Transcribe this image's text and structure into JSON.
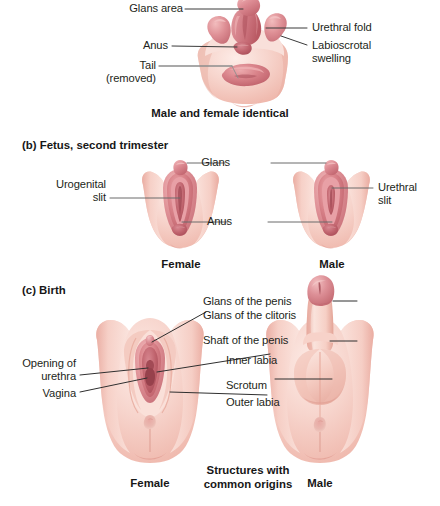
{
  "figure": {
    "title_visible": false,
    "panels": [
      {
        "id": "panel-a",
        "section_label": "",
        "caption": "Male and female identical",
        "labels": [
          {
            "name": "glans-area",
            "text": "Glans area",
            "align": "right"
          },
          {
            "name": "anus",
            "text": "Anus",
            "align": "right"
          },
          {
            "name": "tail-removed-line1",
            "text": "Tail",
            "align": "right"
          },
          {
            "name": "tail-removed-line2",
            "text": "(removed)",
            "align": "right"
          },
          {
            "name": "urethral-fold",
            "text": "Urethral fold",
            "align": "left"
          },
          {
            "name": "labioscrotal-swelling-line1",
            "text": "Labioscrotal",
            "align": "left"
          },
          {
            "name": "labioscrotal-swelling-line2",
            "text": "swelling",
            "align": "left"
          }
        ]
      },
      {
        "id": "panel-b",
        "section_label": "(b) Fetus, second trimester",
        "captions": [
          "Female",
          "Male"
        ],
        "labels": [
          {
            "name": "glans",
            "text": "Glans",
            "align": "right"
          },
          {
            "name": "anus",
            "text": "Anus",
            "align": "right"
          },
          {
            "name": "urogenital-slit-line1",
            "text": "Urogenital",
            "align": "right"
          },
          {
            "name": "urogenital-slit-line2",
            "text": "slit",
            "align": "right"
          },
          {
            "name": "urethral-slit-line1",
            "text": "Urethral",
            "align": "left"
          },
          {
            "name": "urethral-slit-line2",
            "text": "slit",
            "align": "left"
          }
        ]
      },
      {
        "id": "panel-c",
        "section_label": "(c) Birth",
        "captions": [
          "Female",
          "Male"
        ],
        "center_caption_line1": "Structures with",
        "center_caption_line2": "common origins",
        "labels": [
          {
            "name": "opening-of-urethra-line1",
            "text": "Opening of",
            "align": "right"
          },
          {
            "name": "opening-of-urethra-line2",
            "text": "urethra",
            "align": "right"
          },
          {
            "name": "vagina",
            "text": "Vagina",
            "align": "right"
          },
          {
            "name": "glans-of-the-penis",
            "text": "Glans of the penis",
            "align": "left"
          },
          {
            "name": "glans-of-the-clitoris",
            "text": "Glans of the clitoris",
            "align": "left"
          },
          {
            "name": "shaft-of-the-penis",
            "text": "Shaft of the penis",
            "align": "left"
          },
          {
            "name": "inner-labia",
            "text": "Inner labia",
            "align": "left"
          },
          {
            "name": "scrotum",
            "text": "Scrotum",
            "align": "left"
          },
          {
            "name": "outer-labia",
            "text": "Outer labia",
            "align": "left"
          }
        ]
      }
    ]
  },
  "text": {
    "a_glans_area": "Glans area",
    "a_anus": "Anus",
    "a_tail": "Tail",
    "a_removed": "(removed)",
    "a_urethral_fold": "Urethral fold",
    "a_labioscrotal": "Labioscrotal",
    "a_swelling": "swelling",
    "a_caption": "Male and female identical",
    "b_section": "(b) Fetus, second trimester",
    "b_glans": "Glans",
    "b_urogenital": "Urogenital",
    "b_slit": "slit",
    "b_anus": "Anus",
    "b_urethral": "Urethral",
    "b_urethral_slit": "slit",
    "b_female": "Female",
    "b_male": "Male",
    "c_section": "(c) Birth",
    "c_opening_of": "Opening of",
    "c_urethra": "urethra",
    "c_vagina": "Vagina",
    "c_glans_penis": "Glans of the penis",
    "c_glans_clitoris": "Glans of the clitoris",
    "c_shaft_penis": "Shaft of the penis",
    "c_inner_labia": "Inner labia",
    "c_scrotum": "Scrotum",
    "c_outer_labia": "Outer labia",
    "c_female": "Female",
    "c_male": "Male",
    "c_structures": "Structures with",
    "c_common_origins": "common origins"
  },
  "colors": {
    "background": "#ffffff",
    "skin_light": "#f8ddd6",
    "skin_mid": "#f3c5bb",
    "skin_shadow": "#e8a79c",
    "rose_light": "#e59a9e",
    "rose_mid": "#d4787f",
    "rose_dark": "#c1636c",
    "rose_deep": "#b0525c",
    "leader_line": "#3b3b3b",
    "leader_line_grey": "#8d8d8d",
    "text": "#231f20"
  }
}
